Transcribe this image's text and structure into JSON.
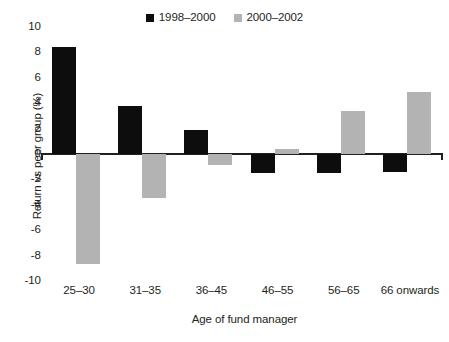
{
  "chart_data": {
    "type": "bar",
    "title": "",
    "xlabel": "Age of fund manager",
    "ylabel": "Return vs peer group (%)",
    "categories": [
      "25–30",
      "31–35",
      "36–45",
      "46–55",
      "56–65",
      "66 onwards"
    ],
    "series": [
      {
        "name": "1998–2000",
        "color": "#0d0d0d",
        "values": [
          8.4,
          3.8,
          1.9,
          -1.5,
          -1.5,
          -1.4
        ]
      },
      {
        "name": "2000–2002",
        "color": "#b3b3b3",
        "values": [
          -8.7,
          -3.5,
          -0.9,
          0.4,
          3.4,
          4.9
        ]
      }
    ],
    "ylim": [
      -10,
      10
    ],
    "ytick_labels": [
      "10",
      "8",
      "6",
      "4",
      "2",
      "0",
      "-2",
      "-4",
      "-6",
      "-8",
      "-10"
    ],
    "yticks": [
      10,
      8,
      6,
      4,
      2,
      0,
      -2,
      -4,
      -6,
      -8,
      -10
    ],
    "grid": false,
    "legend_position": "top-center",
    "zero_line": true
  },
  "legend": {
    "items": [
      {
        "label": "1998–2000",
        "color": "#0d0d0d",
        "swatch": "square-swatch"
      },
      {
        "label": "2000–2002",
        "color": "#b3b3b3",
        "swatch": "square-swatch"
      }
    ]
  },
  "axes": {
    "y_title": "Return vs peer group (%)",
    "x_title": "Age of fund manager"
  }
}
